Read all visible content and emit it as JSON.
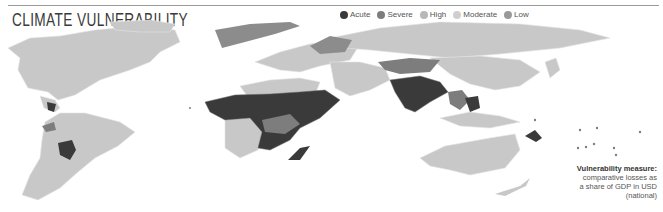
{
  "title": "CLIMATE VULNERABILITY",
  "legend": {
    "items": [
      {
        "label": "Acute",
        "color": "#3a3a3a"
      },
      {
        "label": "Severe",
        "color": "#7d7d7d"
      },
      {
        "label": "High",
        "color": "#b8b8b8"
      },
      {
        "label": "Moderate",
        "color": "#cfcfcf"
      },
      {
        "label": "Low",
        "color": "#9a9a9a"
      }
    ]
  },
  "note": {
    "heading": "Vulnerability measure:",
    "lines": [
      "comparative losses as",
      "a share of GDP in USD",
      "(national)"
    ]
  },
  "colors": {
    "acute": "#3a3a3a",
    "severe": "#7d7d7d",
    "high": "#bdbdbd",
    "land": "#c8c8c8",
    "border": "#e6e6e6"
  }
}
